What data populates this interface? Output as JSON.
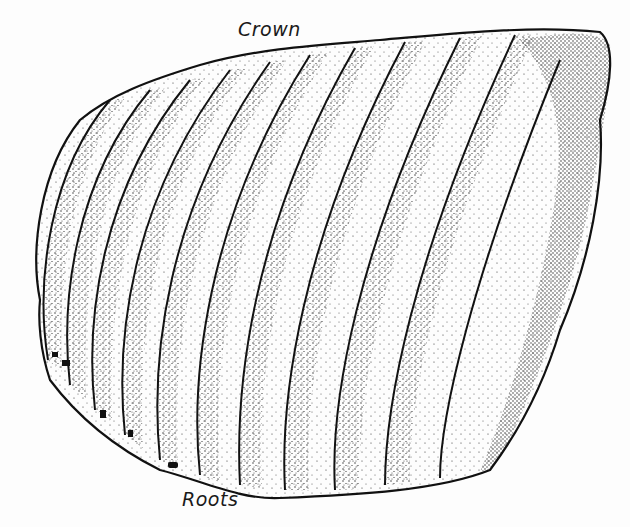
{
  "figure": {
    "labels": {
      "crown": "Crown",
      "roots": "Roots"
    },
    "colors": {
      "ink": "#111111",
      "paper": "#fdfdfd"
    }
  }
}
